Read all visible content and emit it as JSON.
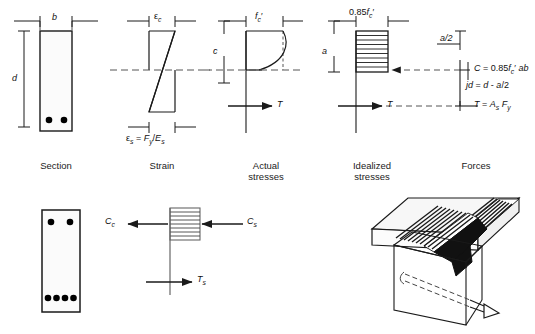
{
  "figure": {
    "type": "engineering-diagram"
  },
  "captions": {
    "section": "Section",
    "strain": "Strain",
    "actual_stresses_line1": "Actual",
    "actual_stresses_line2": "stresses",
    "idealized_stresses_line1": "Idealized",
    "idealized_stresses_line2": "stresses",
    "forces": "Forces"
  },
  "section_panel": {
    "width_label": "b",
    "depth_label": "d",
    "rebar_count": 2
  },
  "strain_panel": {
    "top_strain": "ε",
    "top_strain_sub": "c",
    "bottom_strain_eq": "εs = Fy/Es"
  },
  "actual_panel": {
    "neutral_axis_label": "c",
    "stress_label": "f",
    "stress_label_sub": "c",
    "stress_label_prime": "'",
    "tension_label": "T"
  },
  "idealized_panel": {
    "block_depth_label": "a",
    "stress_label": "0.85f",
    "stress_label_sub": "c",
    "stress_label_prime": "'",
    "tension_label": "T"
  },
  "forces_panel": {
    "lever_top": "a/2",
    "compression_eq_prefix": "C = 0.85f",
    "compression_eq_sub": "c",
    "compression_eq_suffix": "' ab",
    "moment_arm_eq": "jd = d - a/2",
    "tension_eq_prefix": "T = A",
    "tension_eq_sub1": "s",
    "tension_eq_mid": " F",
    "tension_eq_sub2": "y"
  },
  "bottom_section_panel": {
    "top_rebar_count": 2,
    "bottom_rebar_count": 4
  },
  "bottom_forces_panel": {
    "concrete_compression": "C",
    "concrete_compression_sub": "c",
    "steel_compression": "C",
    "steel_compression_sub": "s",
    "tension": "T",
    "tension_sub": "s"
  },
  "beam_3d_panel": {
    "description": "isometric cracked beam with reinforcement bar"
  },
  "colors": {
    "line": "#1a1a1a",
    "fill_light": "#f2f2f2",
    "dash": "#555555",
    "dark": "#000000"
  }
}
